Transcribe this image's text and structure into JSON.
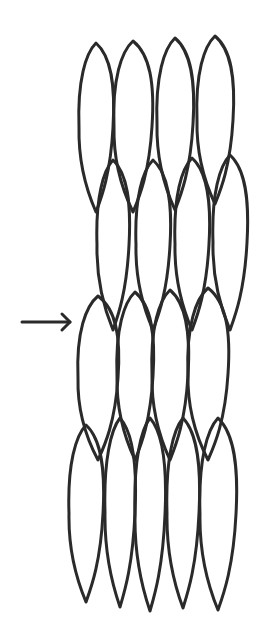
{
  "diagram": {
    "description": "Line drawing of spindle-shaped cells arranged in four overlapping horizontal tiers, with an arrow pointing to the third tier",
    "stroke_color": "#2a2a2a",
    "background": "#ffffff",
    "arrow": {
      "x1": 22,
      "y1": 322,
      "x2": 70,
      "y2": 322,
      "target_tier": 3
    },
    "tiers": [
      {
        "name": "tier-1",
        "cells": [
          {
            "cx": 96,
            "top": 43,
            "bottom": 212,
            "w": 34
          },
          {
            "cx": 133,
            "top": 41,
            "bottom": 212,
            "w": 38
          },
          {
            "cx": 175,
            "top": 38,
            "bottom": 210,
            "w": 36
          },
          {
            "cx": 215,
            "top": 36,
            "bottom": 204,
            "w": 36
          }
        ]
      },
      {
        "name": "tier-2",
        "cells": [
          {
            "cx": 113,
            "top": 160,
            "bottom": 330,
            "w": 32
          },
          {
            "cx": 153,
            "top": 160,
            "bottom": 330,
            "w": 34
          },
          {
            "cx": 192,
            "top": 158,
            "bottom": 330,
            "w": 34
          },
          {
            "cx": 230,
            "top": 155,
            "bottom": 330,
            "w": 34
          }
        ]
      },
      {
        "name": "tier-3",
        "cells": [
          {
            "cx": 98,
            "top": 296,
            "bottom": 460,
            "w": 40
          },
          {
            "cx": 135,
            "top": 292,
            "bottom": 460,
            "w": 36
          },
          {
            "cx": 170,
            "top": 290,
            "bottom": 460,
            "w": 36
          },
          {
            "cx": 208,
            "top": 288,
            "bottom": 460,
            "w": 40
          }
        ]
      },
      {
        "name": "tier-4",
        "cells": [
          {
            "cx": 86,
            "top": 425,
            "bottom": 602,
            "w": 34
          },
          {
            "cx": 120,
            "top": 418,
            "bottom": 607,
            "w": 30
          },
          {
            "cx": 150,
            "top": 418,
            "bottom": 611,
            "w": 30
          },
          {
            "cx": 183,
            "top": 418,
            "bottom": 608,
            "w": 32
          },
          {
            "cx": 218,
            "top": 418,
            "bottom": 610,
            "w": 36
          }
        ]
      }
    ]
  }
}
